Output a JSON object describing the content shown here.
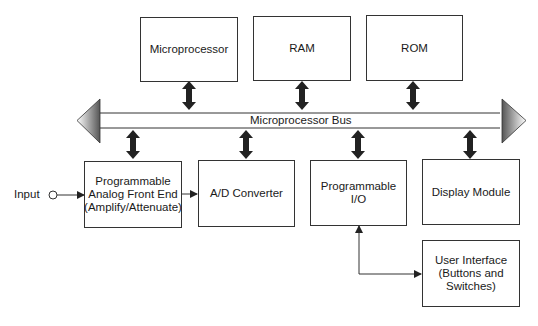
{
  "diagram": {
    "bus": {
      "label": "Microprocessor Bus"
    },
    "top_blocks": [
      {
        "id": "microprocessor",
        "label": "Microprocessor"
      },
      {
        "id": "ram",
        "label": "RAM"
      },
      {
        "id": "rom",
        "label": "ROM"
      }
    ],
    "bottom_blocks": [
      {
        "id": "afe",
        "label": "Programmable\nAnalog Front End\n(Amplify/Attenuate)"
      },
      {
        "id": "adc",
        "label": "A/D Converter"
      },
      {
        "id": "pio",
        "label": "Programmable\nI/O"
      },
      {
        "id": "display",
        "label": "Display  Module"
      }
    ],
    "user_interface": {
      "label": "User Interface\n(Buttons and\nSwitches)"
    },
    "input": {
      "label": "Input"
    },
    "connections": [
      {
        "from": "microprocessor",
        "to": "bus",
        "type": "bidirectional"
      },
      {
        "from": "ram",
        "to": "bus",
        "type": "bidirectional"
      },
      {
        "from": "rom",
        "to": "bus",
        "type": "bidirectional"
      },
      {
        "from": "bus",
        "to": "afe",
        "type": "bidirectional"
      },
      {
        "from": "bus",
        "to": "adc",
        "type": "bidirectional"
      },
      {
        "from": "bus",
        "to": "pio",
        "type": "bidirectional"
      },
      {
        "from": "bus",
        "to": "display",
        "type": "bidirectional"
      },
      {
        "from": "input",
        "to": "afe",
        "type": "directed"
      },
      {
        "from": "afe",
        "to": "adc",
        "type": "directed"
      },
      {
        "from": "pio",
        "to": "user_interface",
        "type": "bidirectional"
      }
    ]
  }
}
